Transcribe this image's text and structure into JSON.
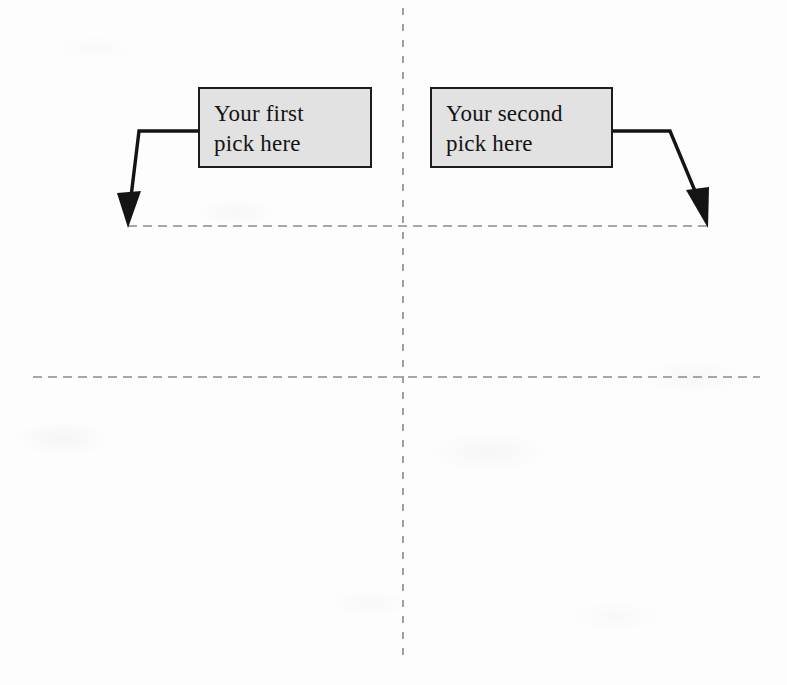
{
  "figure": {
    "background_color": "#fdfdfd",
    "ink_color": "#1c1c1c",
    "guide_color": "#8a8a8a",
    "box_fill_color": "#e2e2e2"
  },
  "callouts": [
    {
      "id": "first-pick",
      "label": "Your first\npick here",
      "line1": "Your first",
      "line2": "pick here"
    },
    {
      "id": "second-pick",
      "label": "Your second\npick here",
      "line1": "Your second",
      "line2": "pick here"
    }
  ],
  "guides": {
    "vertical_axis": {
      "x": 403,
      "y_start": 8,
      "y_end": 660
    },
    "upper_horizontal": {
      "y": 226,
      "x_start": 128,
      "x_end": 710
    },
    "lower_horizontal": {
      "y": 377,
      "x_start": 33,
      "x_end": 760
    },
    "intersection": {
      "x": 403,
      "y": 377
    }
  },
  "arrows": [
    {
      "id": "arrow-first-pick",
      "from": "first-pick",
      "direction": "down-left",
      "target_point": {
        "x": 128,
        "y": 226
      }
    },
    {
      "id": "arrow-second-pick",
      "from": "second-pick",
      "direction": "down-right",
      "target_point": {
        "x": 707,
        "y": 226
      }
    }
  ]
}
